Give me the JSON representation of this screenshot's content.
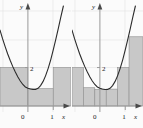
{
  "figure": {
    "title": "",
    "background_color": "#fbfbfb",
    "bar_fill_color": "#c8c8c8",
    "bar_stroke_color": "#8e8e8e",
    "curve_color": "#2b2b2b",
    "axis_color": "#9a9a9a",
    "grid_color": "#e2e2e2"
  },
  "chart_data": [
    {
      "type": "bar",
      "name": "left-panel",
      "title": "",
      "xlabel": "x",
      "ylabel": "y",
      "xlim": [
        -1.1,
        1.7
      ],
      "ylim": [
        0,
        5.2
      ],
      "xticks": [
        0,
        1
      ],
      "xticklabels": [
        "0",
        "1"
      ],
      "yticks": [
        2
      ],
      "yticklabels": [
        "2"
      ],
      "grid": true,
      "legend": "none",
      "bar_edges": [
        -1.1,
        0,
        1,
        1.7
      ],
      "categories": [
        "[-1.1, 0]",
        "[0, 1]",
        "[1, 1.7]"
      ],
      "values": [
        2.0,
        0.9,
        2.0
      ],
      "curve": {
        "label": "",
        "description": "upward parabola with minimum near x = 0.3",
        "points": [
          {
            "x": -1.1,
            "y": 3.95
          },
          {
            "x": -1.0,
            "y": 3.5
          },
          {
            "x": -0.9,
            "y": 3.1
          },
          {
            "x": -0.8,
            "y": 2.72
          },
          {
            "x": -0.7,
            "y": 2.38
          },
          {
            "x": -0.6,
            "y": 2.06
          },
          {
            "x": -0.5,
            "y": 1.78
          },
          {
            "x": -0.4,
            "y": 1.52
          },
          {
            "x": -0.3,
            "y": 1.3
          },
          {
            "x": -0.2,
            "y": 1.12
          },
          {
            "x": -0.1,
            "y": 0.99
          },
          {
            "x": 0.0,
            "y": 0.92
          },
          {
            "x": 0.1,
            "y": 0.88
          },
          {
            "x": 0.2,
            "y": 0.86
          },
          {
            "x": 0.3,
            "y": 0.86
          },
          {
            "x": 0.4,
            "y": 0.92
          },
          {
            "x": 0.5,
            "y": 1.06
          },
          {
            "x": 0.6,
            "y": 1.28
          },
          {
            "x": 0.7,
            "y": 1.58
          },
          {
            "x": 0.8,
            "y": 1.96
          },
          {
            "x": 0.9,
            "y": 2.4
          },
          {
            "x": 1.0,
            "y": 2.92
          },
          {
            "x": 1.1,
            "y": 3.46
          },
          {
            "x": 1.2,
            "y": 4.04
          },
          {
            "x": 1.3,
            "y": 4.64
          },
          {
            "x": 1.4,
            "y": 5.2
          }
        ]
      }
    },
    {
      "type": "bar",
      "name": "right-panel",
      "title": "",
      "xlabel": "x",
      "ylabel": "y",
      "xlim": [
        -1.1,
        1.7
      ],
      "ylim": [
        0,
        5.2
      ],
      "xticks": [
        0,
        1
      ],
      "xticklabels": [
        "0",
        "1"
      ],
      "yticks": [
        2
      ],
      "yticklabels": [
        "2"
      ],
      "grid": true,
      "legend": "none",
      "bar_edges": [
        -1.1,
        -0.65,
        -0.2,
        0.25,
        0.7,
        1.15,
        1.7
      ],
      "categories": [
        "[-1.1, -0.65]",
        "[-0.65, -0.2]",
        "[-0.2, 0.25]",
        "[0.25, 0.7]",
        "[0.7, 1.15]",
        "[1.15, 1.7]"
      ],
      "values": [
        2.0,
        0.95,
        0.86,
        0.88,
        2.0,
        3.6
      ],
      "curve": {
        "label": "",
        "description": "upward parabola with minimum near x = 0.3",
        "points": [
          {
            "x": -1.1,
            "y": 3.95
          },
          {
            "x": -1.0,
            "y": 3.5
          },
          {
            "x": -0.9,
            "y": 3.1
          },
          {
            "x": -0.8,
            "y": 2.72
          },
          {
            "x": -0.7,
            "y": 2.38
          },
          {
            "x": -0.6,
            "y": 2.06
          },
          {
            "x": -0.5,
            "y": 1.78
          },
          {
            "x": -0.4,
            "y": 1.52
          },
          {
            "x": -0.3,
            "y": 1.3
          },
          {
            "x": -0.2,
            "y": 1.12
          },
          {
            "x": -0.1,
            "y": 0.99
          },
          {
            "x": 0.0,
            "y": 0.92
          },
          {
            "x": 0.1,
            "y": 0.88
          },
          {
            "x": 0.2,
            "y": 0.86
          },
          {
            "x": 0.3,
            "y": 0.86
          },
          {
            "x": 0.4,
            "y": 0.92
          },
          {
            "x": 0.5,
            "y": 1.06
          },
          {
            "x": 0.6,
            "y": 1.28
          },
          {
            "x": 0.7,
            "y": 1.58
          },
          {
            "x": 0.8,
            "y": 1.96
          },
          {
            "x": 0.9,
            "y": 2.4
          },
          {
            "x": 1.0,
            "y": 2.92
          },
          {
            "x": 1.1,
            "y": 3.46
          },
          {
            "x": 1.2,
            "y": 4.04
          },
          {
            "x": 1.3,
            "y": 4.64
          },
          {
            "x": 1.4,
            "y": 5.2
          }
        ]
      }
    }
  ],
  "labels": {
    "y_axis": "y",
    "x_axis": "x",
    "origin": "0",
    "x_one": "1",
    "y_two": "2"
  }
}
